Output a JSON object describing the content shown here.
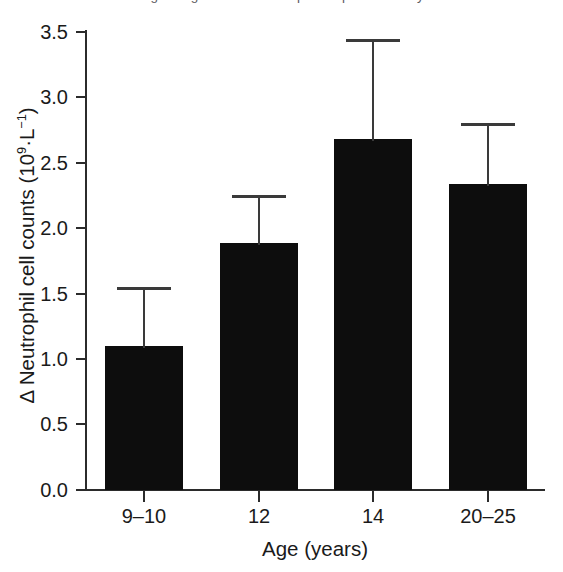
{
  "figure": {
    "caption_remnant": "Figure  Age-related neutrophil responses study",
    "background_color": "#ffffff",
    "bar_color": "#0d0d0d",
    "axis_color": "#2b2b2b"
  },
  "axis": {
    "y_label_prefix": "Δ Neutrophil cell counts (10",
    "y_label_exp1": "9",
    "y_label_mid": "·L",
    "y_label_exp2": "−1",
    "y_label_suffix": ")",
    "y_label_full": "Δ Neutrophil cell counts (10⁹·L⁻¹)",
    "x_label": "Age (years)",
    "y_ticks": [
      "0.0",
      "0.5",
      "1.0",
      "1.5",
      "2.0",
      "2.5",
      "3.0",
      "3.5"
    ]
  },
  "chart_data": {
    "type": "bar",
    "title": "",
    "xlabel": "Age (years)",
    "ylabel": "Δ Neutrophil cell counts (10⁹·L⁻¹)",
    "categories": [
      "9–10",
      "12",
      "14",
      "20–25"
    ],
    "values": [
      1.1,
      1.88,
      2.68,
      2.33
    ],
    "errors_upper": [
      0.45,
      0.37,
      0.76,
      0.47
    ],
    "error_tops": [
      1.55,
      2.25,
      3.44,
      2.8
    ],
    "error_type": "upper-only",
    "ylim": [
      0.0,
      3.5
    ],
    "ytick_values": [
      0.0,
      0.5,
      1.0,
      1.5,
      2.0,
      2.5,
      3.0,
      3.5
    ],
    "grid": false,
    "legend": "none",
    "series": [
      {
        "name": "Δ Neutrophil cell counts",
        "values": [
          1.1,
          1.88,
          2.68,
          2.33
        ]
      }
    ]
  }
}
